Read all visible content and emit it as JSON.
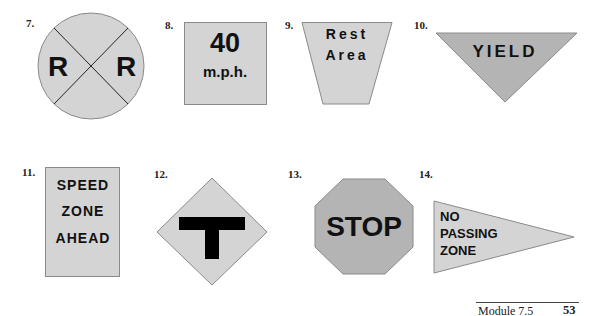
{
  "colors": {
    "sign_light": "#d4d4d4",
    "sign_medium": "#b4b4b4",
    "sign_stroke": "#8a8a8a",
    "text": "#111111"
  },
  "signs": [
    {
      "number": "7.",
      "shape": "circle-crossbuck",
      "text": [
        "R",
        "R"
      ]
    },
    {
      "number": "8.",
      "shape": "square",
      "text": [
        "40",
        "m.p.h."
      ]
    },
    {
      "number": "9.",
      "shape": "trapezoid",
      "text": [
        "Rest",
        "Area"
      ]
    },
    {
      "number": "10.",
      "shape": "inverted-triangle",
      "text": [
        "YIELD"
      ]
    },
    {
      "number": "11.",
      "shape": "rectangle-vertical",
      "text": [
        "SPEED",
        "ZONE",
        "AHEAD"
      ]
    },
    {
      "number": "12.",
      "shape": "diamond",
      "symbol": "t-intersection"
    },
    {
      "number": "13.",
      "shape": "octagon",
      "text": [
        "STOP"
      ]
    },
    {
      "number": "14.",
      "shape": "pennant",
      "text": [
        "NO",
        "PASSING",
        "ZONE"
      ]
    }
  ],
  "footer": {
    "module": "Module 7.5",
    "page": "53"
  }
}
